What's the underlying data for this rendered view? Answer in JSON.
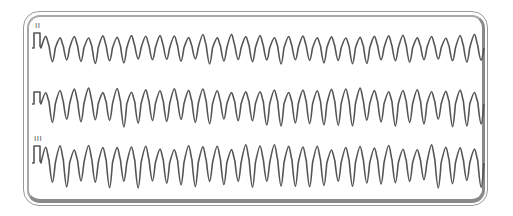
{
  "figure": {
    "type": "ecg-rhythm-strip",
    "colors": {
      "trace": "#555555",
      "frame": "#8a8a8a",
      "background": "#ffffff"
    }
  },
  "leads": [
    {
      "label": "II",
      "baseline_y": 48,
      "cal_top": 33,
      "amp_up": 12,
      "amp_down": 14,
      "start_x": 41,
      "end_x": 484,
      "cycles": 31
    },
    {
      "label": "",
      "baseline_y": 104,
      "cal_top": 92,
      "amp_up": 14,
      "amp_down": 20,
      "start_x": 41,
      "end_x": 484,
      "cycles": 31
    },
    {
      "label": "III",
      "baseline_y": 163,
      "cal_top": 146,
      "amp_up": 16,
      "amp_down": 22,
      "start_x": 41,
      "end_x": 484,
      "cycles": 31
    }
  ]
}
